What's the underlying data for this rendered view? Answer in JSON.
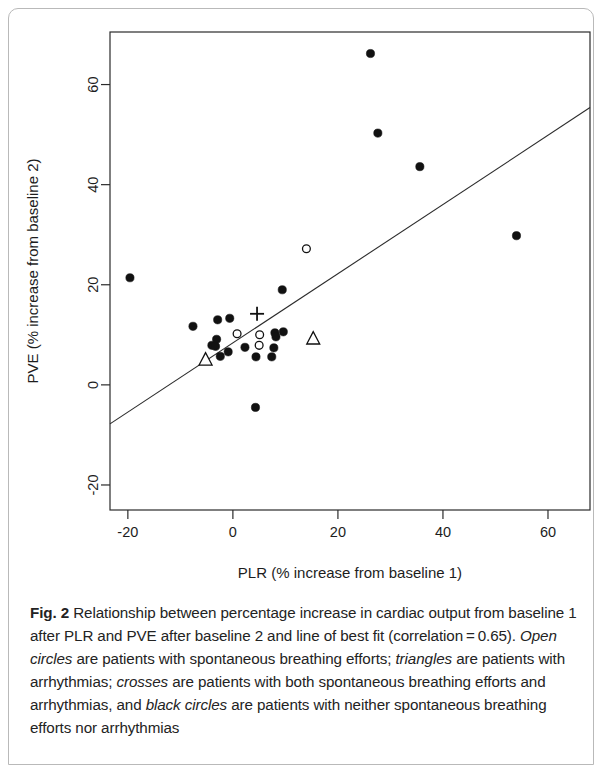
{
  "figure": {
    "label": "Fig. 2",
    "caption_segments": [
      {
        "text": "Fig. 2",
        "style": "bold"
      },
      {
        "text": " Relationship between percentage increase in cardiac output from baseline 1 after PLR and PVE after baseline 2 and line of best fit (correlation = 0.65). ",
        "style": "normal"
      },
      {
        "text": "Open circles",
        "style": "italic"
      },
      {
        "text": " are patients with spontaneous breathing efforts; ",
        "style": "normal"
      },
      {
        "text": "triangles",
        "style": "italic"
      },
      {
        "text": " are patients with arrhythmias; ",
        "style": "normal"
      },
      {
        "text": "crosses",
        "style": "italic"
      },
      {
        "text": " are patients with both spontaneous breathing efforts and arrhythmias, and ",
        "style": "normal"
      },
      {
        "text": "black circles",
        "style": "italic"
      },
      {
        "text": " are patients with neither spontaneous breathing efforts nor arrhythmias",
        "style": "normal"
      }
    ],
    "caption_plain": "Fig. 2 Relationship between percentage increase in cardiac output from baseline 1 after PLR and PVE after baseline 2 and line of best fit (correlation = 0.65). Open circles are patients with spontaneous breathing efforts; triangles are patients with arrhythmias; crosses are patients with both spontaneous breathing efforts and arrhythmias, and black circles are patients with neither spontaneous breathing efforts nor arrhythmias"
  },
  "chart_data": {
    "type": "scatter",
    "title": "",
    "xlabel": "PLR (% increase from baseline 1)",
    "ylabel": "PVE (% increase from baseline 2)",
    "xlim": [
      -23.4,
      68.0
    ],
    "ylim": [
      -25.0,
      70.5
    ],
    "xticks": [
      -20,
      0,
      20,
      40,
      60
    ],
    "xtick_labels": [
      "-20",
      "0",
      "20",
      "40",
      "60"
    ],
    "yticks": [
      -20,
      0,
      20,
      40,
      60
    ],
    "ytick_labels": [
      "-20",
      "0",
      "20",
      "40",
      "60"
    ],
    "grid": false,
    "legend": "none",
    "correlation": 0.65,
    "fit_line": {
      "label": "line of best fit",
      "x_start": -23.4,
      "y_start": -7.8,
      "x_end": 68.0,
      "y_end": 55.4,
      "color": "#2b2b2b"
    },
    "series": [
      {
        "name": "black circles",
        "marker": "filled-circle",
        "color": "#111111",
        "description": "patients with neither spontaneous breathing efforts nor arrhythmias",
        "points": [
          {
            "x": -19.6,
            "y": 21.4
          },
          {
            "x": -7.6,
            "y": 11.7
          },
          {
            "x": -2.9,
            "y": 13.0
          },
          {
            "x": -0.6,
            "y": 13.3
          },
          {
            "x": -3.1,
            "y": 9.1
          },
          {
            "x": -4.0,
            "y": 7.9
          },
          {
            "x": -3.3,
            "y": 7.7
          },
          {
            "x": -2.4,
            "y": 5.7
          },
          {
            "x": -0.9,
            "y": 6.6
          },
          {
            "x": 2.3,
            "y": 7.5
          },
          {
            "x": 4.4,
            "y": 5.6
          },
          {
            "x": 7.4,
            "y": 5.6
          },
          {
            "x": 8.0,
            "y": 10.4
          },
          {
            "x": 8.2,
            "y": 9.6
          },
          {
            "x": 9.6,
            "y": 10.6
          },
          {
            "x": 7.8,
            "y": 7.4
          },
          {
            "x": 9.4,
            "y": 19.0
          },
          {
            "x": 4.3,
            "y": -4.5
          },
          {
            "x": 26.2,
            "y": 66.2
          },
          {
            "x": 27.6,
            "y": 50.3
          },
          {
            "x": 35.6,
            "y": 43.6
          },
          {
            "x": 54.0,
            "y": 29.8
          }
        ]
      },
      {
        "name": "open circles",
        "marker": "open-circle",
        "color": "#111111",
        "description": "patients with spontaneous breathing efforts",
        "points": [
          {
            "x": 0.8,
            "y": 10.2
          },
          {
            "x": 5.1,
            "y": 10.0
          },
          {
            "x": 5.0,
            "y": 7.9
          },
          {
            "x": 14.0,
            "y": 27.2
          }
        ]
      },
      {
        "name": "triangles",
        "marker": "open-triangle",
        "color": "#111111",
        "description": "patients with arrhythmias",
        "points": [
          {
            "x": -5.2,
            "y": 5.0
          },
          {
            "x": 15.3,
            "y": 9.2
          }
        ]
      },
      {
        "name": "crosses",
        "marker": "plus",
        "color": "#111111",
        "description": "patients with both spontaneous breathing efforts and arrhythmias",
        "points": [
          {
            "x": 4.6,
            "y": 14.2
          }
        ]
      }
    ]
  }
}
